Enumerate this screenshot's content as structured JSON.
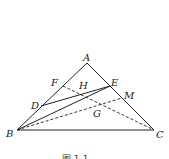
{
  "diagram": {
    "points": {
      "A": {
        "label": "A",
        "x": 87,
        "y": 63
      },
      "B": {
        "label": "B",
        "x": 17,
        "y": 130
      },
      "C": {
        "label": "C",
        "x": 154,
        "y": 130
      },
      "D": {
        "label": "D",
        "x": 41,
        "y": 106
      },
      "E": {
        "label": "E",
        "x": 110,
        "y": 86
      },
      "F": {
        "label": "F",
        "x": 63,
        "y": 86
      },
      "M": {
        "label": "M",
        "x": 122,
        "y": 98
      },
      "H": {
        "label": "H"
      },
      "G": {
        "label": "G"
      }
    },
    "solid_segments": [
      "AB",
      "AC",
      "BC",
      "DE",
      "BE"
    ],
    "dashed_segments": [
      "FC",
      "BM"
    ],
    "caption": "图 1-1"
  }
}
